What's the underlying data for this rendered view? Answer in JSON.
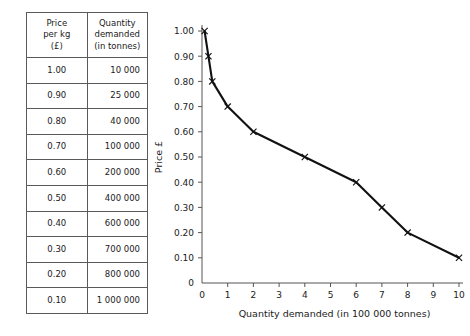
{
  "table": {
    "headers": [
      {
        "lines": [
          "Price",
          "per kg",
          "(£)"
        ]
      },
      {
        "lines": [
          "Quantity",
          "demanded",
          "(in tonnes)"
        ]
      }
    ],
    "rows": [
      {
        "price": "1.00",
        "quantity": "10 000"
      },
      {
        "price": "0.90",
        "quantity": "25 000"
      },
      {
        "price": "0.80",
        "quantity": "40 000"
      },
      {
        "price": "0.70",
        "quantity": "100 000"
      },
      {
        "price": "0.60",
        "quantity": "200 000"
      },
      {
        "price": "0.50",
        "quantity": "400 000"
      },
      {
        "price": "0.40",
        "quantity": "600 000"
      },
      {
        "price": "0.30",
        "quantity": "700 000"
      },
      {
        "price": "0.20",
        "quantity": "800 000"
      },
      {
        "price": "0.10",
        "quantity": "1 000 000"
      }
    ]
  },
  "chart_data": {
    "type": "line",
    "title": "",
    "xlabel": "Quantity demanded (in 100 000 tonnes)",
    "ylabel": "Price £",
    "xlim": [
      0,
      10
    ],
    "ylim": [
      0,
      1.0
    ],
    "grid": false,
    "legend": null,
    "xticks": [
      "0",
      "1",
      "2",
      "3",
      "4",
      "5",
      "6",
      "7",
      "8",
      "9",
      "10"
    ],
    "xtick_values": [
      0,
      1,
      2,
      3,
      4,
      5,
      6,
      7,
      8,
      9,
      10
    ],
    "yticks": [
      "0",
      "0.10",
      "0.20",
      "0.30",
      "0.40",
      "0.50",
      "0.60",
      "0.70",
      "0.80",
      "0.90",
      "1.00"
    ],
    "ytick_values": [
      0,
      0.1,
      0.2,
      0.3,
      0.4,
      0.5,
      0.6,
      0.7,
      0.8,
      0.9,
      1.0
    ],
    "marker": "x",
    "x": [
      0.1,
      0.25,
      0.4,
      1.0,
      2.0,
      4.0,
      6.0,
      7.0,
      8.0,
      10.0
    ],
    "y": [
      1.0,
      0.9,
      0.8,
      0.7,
      0.6,
      0.5,
      0.4,
      0.3,
      0.2,
      0.1
    ],
    "series": [
      {
        "name": "Demand curve",
        "points": [
          {
            "x": 0.1,
            "y": 1.0
          },
          {
            "x": 0.25,
            "y": 0.9
          },
          {
            "x": 0.4,
            "y": 0.8
          },
          {
            "x": 1.0,
            "y": 0.7
          },
          {
            "x": 2.0,
            "y": 0.6
          },
          {
            "x": 4.0,
            "y": 0.5
          },
          {
            "x": 6.0,
            "y": 0.4
          },
          {
            "x": 7.0,
            "y": 0.3
          },
          {
            "x": 8.0,
            "y": 0.2
          },
          {
            "x": 10.0,
            "y": 0.1
          }
        ]
      }
    ],
    "colors": {
      "line": "#111111",
      "axis": "#555555",
      "text": "#1a1a1a"
    }
  }
}
